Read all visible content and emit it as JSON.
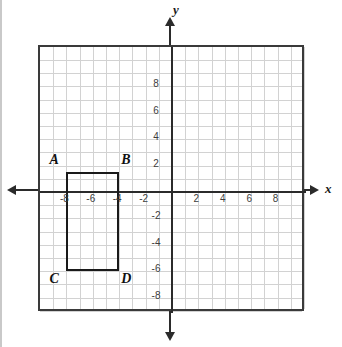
{
  "chart_data": {
    "type": "scatter",
    "title": "",
    "xlabel": "x",
    "ylabel": "y",
    "xlim": [
      -10.5,
      10
    ],
    "ylim": [
      -10,
      10
    ],
    "grid": true,
    "grid_step": 1,
    "legend": "none",
    "x_tick_labels": [
      "-8",
      "-6",
      "-4",
      "-2",
      "2",
      "4",
      "6",
      "8"
    ],
    "x_tick_values": [
      -8,
      -6,
      -4,
      -2,
      2,
      4,
      6,
      8
    ],
    "y_tick_labels": [
      "8",
      "6",
      "4",
      "2",
      "-2",
      "-4",
      "-6",
      "-8"
    ],
    "y_tick_values": [
      8,
      6,
      4,
      2,
      -2,
      -4,
      -6,
      -8
    ],
    "shapes": [
      {
        "name": "rectangle-abcd",
        "kind": "rectangle",
        "vertices": [
          {
            "label": "A",
            "x": -8,
            "y": 1.5
          },
          {
            "label": "B",
            "x": -4,
            "y": 1.5
          },
          {
            "label": "C",
            "x": -8,
            "y": -6
          },
          {
            "label": "D",
            "x": -4,
            "y": -6
          }
        ]
      }
    ],
    "colors": {
      "grid": "#d2d2d2",
      "axis": "#2b2b2b",
      "frame": "#3a3a3a",
      "shape_stroke": "#1a1a1a",
      "tick_text": "#3d3d3d",
      "background": "#ffffff"
    }
  },
  "axis_labels": {
    "x": "x",
    "y": "y"
  },
  "vertex_labels": {
    "a": "A",
    "b": "B",
    "c": "C",
    "d": "D"
  }
}
